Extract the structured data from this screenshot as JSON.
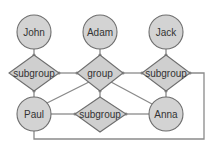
{
  "diagram": {
    "type": "bipartite-graph",
    "colors": {
      "node_fill": "#d3d3d3",
      "node_stroke": "#6e6e6e",
      "edge": "#8a8a8a",
      "text": "#333333"
    },
    "people": [
      {
        "id": "john",
        "label": "John"
      },
      {
        "id": "adam",
        "label": "Adam"
      },
      {
        "id": "jack",
        "label": "Jack"
      },
      {
        "id": "paul",
        "label": "Paul"
      },
      {
        "id": "anna",
        "label": "Anna"
      }
    ],
    "groups": [
      {
        "id": "g_left",
        "label": "subgroup"
      },
      {
        "id": "g_center",
        "label": "group"
      },
      {
        "id": "g_right",
        "label": "subgroup"
      },
      {
        "id": "g_bottom",
        "label": "subgroup"
      }
    ],
    "edges": [
      {
        "from": "john",
        "to": "g_left"
      },
      {
        "from": "adam",
        "to": "g_center"
      },
      {
        "from": "jack",
        "to": "g_right"
      },
      {
        "from": "g_left",
        "to": "g_center"
      },
      {
        "from": "g_center",
        "to": "g_right"
      },
      {
        "from": "paul",
        "to": "g_left"
      },
      {
        "from": "paul",
        "to": "g_center"
      },
      {
        "from": "paul",
        "to": "g_bottom"
      },
      {
        "from": "g_center",
        "to": "g_bottom"
      },
      {
        "from": "g_center",
        "to": "anna"
      },
      {
        "from": "anna",
        "to": "g_right"
      },
      {
        "from": "anna",
        "to": "g_bottom"
      },
      {
        "from": "paul",
        "to": "g_right"
      }
    ]
  }
}
